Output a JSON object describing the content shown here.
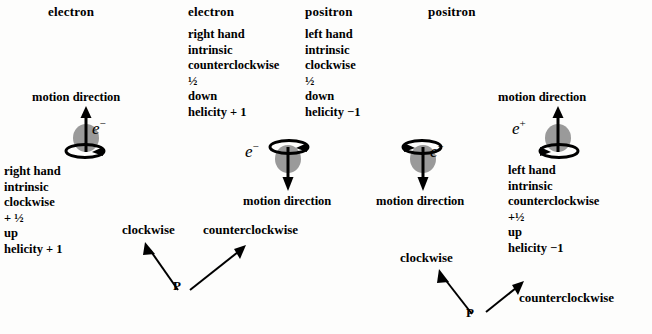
{
  "figure": {
    "caption_bottom": "",
    "parity_operator_label": "P",
    "columns": [
      {
        "header": "electron",
        "particle_symbol": "e",
        "particle_charge": "−",
        "particle_label_side": "right",
        "motion_direction_label": "motion direction",
        "motion_arrow": "up",
        "spin_loop_position": "bottom",
        "attributes": [
          "right hand",
          "intrinsic",
          "clockwise",
          "+ ½",
          "up",
          "helicity + 1"
        ]
      },
      {
        "header": "electron",
        "particle_symbol": "e",
        "particle_charge": "−",
        "particle_label_side": "left",
        "motion_direction_label": "motion direction",
        "motion_arrow": "down",
        "spin_loop_position": "top",
        "attributes": [
          "right hand",
          "intrinsic",
          "counterclockwise",
          "½",
          "down",
          "helicity + 1"
        ]
      },
      {
        "header": "positron",
        "particle_symbol": "e",
        "particle_charge": "+",
        "particle_label_side": "right",
        "motion_direction_label": "motion direction",
        "motion_arrow": "down",
        "spin_loop_position": "top",
        "attributes": [
          "left hand",
          "intrinsic",
          "clockwise",
          "½",
          "down",
          "helicity −1"
        ]
      },
      {
        "header": "positron",
        "particle_symbol": "e",
        "particle_charge": "+",
        "particle_label_side": "left",
        "motion_direction_label": "motion direction",
        "motion_arrow": "up",
        "spin_loop_position": "bottom",
        "attributes": [
          "left hand",
          "intrinsic",
          "counterclockwise",
          "+½",
          "up",
          "helicity −1"
        ]
      }
    ],
    "parity_groups": [
      {
        "operator": "P",
        "left_target": "clockwise",
        "right_target": "counterclockwise"
      },
      {
        "operator": "P",
        "left_target": "clockwise",
        "right_target": "counterclockwise"
      }
    ],
    "colors": {
      "ink": "#000000",
      "sphere_fill": "#9a9a9a",
      "background": "#fdfdfc"
    }
  }
}
